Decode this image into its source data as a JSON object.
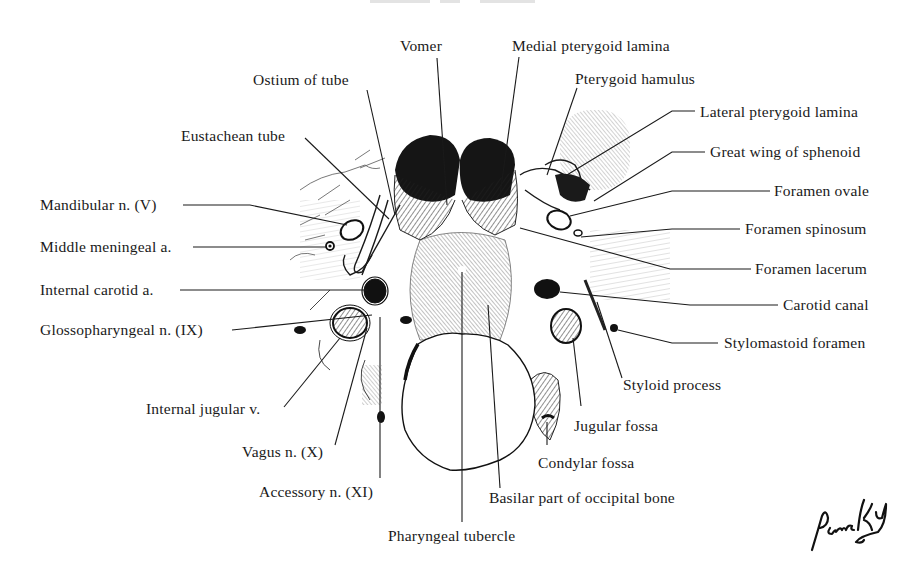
{
  "figure": {
    "title_cropped": true,
    "ink_color": "#1a1a1a",
    "background": "#ffffff"
  },
  "labels": {
    "vomer": "Vomer",
    "medial_pterygoid_lamina": "Medial pterygoid lamina",
    "ostium_of_tube": "Ostium of tube",
    "pterygoid_hamulus": "Pterygoid hamulus",
    "lateral_pterygoid_lamina": "Lateral pterygoid lamina",
    "eustachean_tube": "Eustachean tube",
    "great_wing_of_sphenoid": "Great wing of sphenoid",
    "foramen_ovale": "Foramen ovale",
    "mandibular_n": "Mandibular n. (V)",
    "foramen_spinosum": "Foramen spinosum",
    "middle_meningeal_a": "Middle meningeal a.",
    "foramen_lacerum": "Foramen lacerum",
    "internal_carotid_a": "Internal carotid a.",
    "carotid_canal": "Carotid canal",
    "glossopharyngeal_n": "Glossopharyngeal n. (IX)",
    "stylomastoid_foramen": "Stylomastoid foramen",
    "styloid_process": "Styloid process",
    "internal_jugular_v": "Internal jugular v.",
    "jugular_fossa": "Jugular fossa",
    "vagus_n": "Vagus n. (X)",
    "condylar_fossa": "Condylar fossa",
    "accessory_n": "Accessory n. (XI)",
    "basilar_part": "Basilar part of occipital bone",
    "pharyngeal_tubercle": "Pharyngeal tubercle"
  },
  "signature": "Pansky"
}
